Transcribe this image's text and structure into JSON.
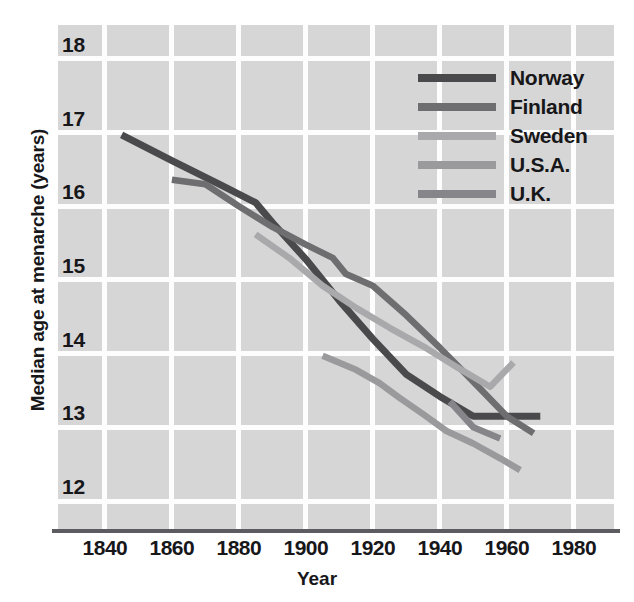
{
  "chart_data": {
    "type": "line",
    "title": "",
    "xlabel": "Year",
    "ylabel": "Median age at menarche (years)",
    "xlim": [
      1826,
      1992
    ],
    "ylim": [
      11.62,
      18.46
    ],
    "xticks": [
      1840,
      1860,
      1880,
      1900,
      1920,
      1940,
      1960,
      1980
    ],
    "yticks": [
      12,
      13,
      14,
      15,
      16,
      17,
      18
    ],
    "grid": true,
    "legend_position": "top-right",
    "background_color": "#d6d6d6",
    "gridline_color": "#fdfdfd",
    "series": [
      {
        "name": "Norway",
        "color": "#4a4a4d",
        "points": [
          [
            1845,
            16.97
          ],
          [
            1860,
            16.62
          ],
          [
            1875,
            16.28
          ],
          [
            1885,
            16.05
          ],
          [
            1890,
            15.78
          ],
          [
            1900,
            15.28
          ],
          [
            1910,
            14.72
          ],
          [
            1920,
            14.2
          ],
          [
            1930,
            13.72
          ],
          [
            1940,
            13.42
          ],
          [
            1950,
            13.15
          ],
          [
            1970,
            13.15
          ]
        ]
      },
      {
        "name": "Finland",
        "color": "#6e6e71",
        "points": [
          [
            1860,
            16.36
          ],
          [
            1870,
            16.3
          ],
          [
            1880,
            16.0
          ],
          [
            1890,
            15.72
          ],
          [
            1900,
            15.48
          ],
          [
            1908,
            15.3
          ],
          [
            1912,
            15.08
          ],
          [
            1920,
            14.92
          ],
          [
            1930,
            14.52
          ],
          [
            1940,
            14.08
          ],
          [
            1950,
            13.62
          ],
          [
            1960,
            13.15
          ],
          [
            1968,
            12.92
          ]
        ]
      },
      {
        "name": "Sweden",
        "color": "#a9a9ac",
        "points": [
          [
            1885,
            15.62
          ],
          [
            1895,
            15.3
          ],
          [
            1905,
            14.92
          ],
          [
            1915,
            14.62
          ],
          [
            1925,
            14.35
          ],
          [
            1935,
            14.1
          ],
          [
            1945,
            13.82
          ],
          [
            1955,
            13.55
          ],
          [
            1962,
            13.88
          ]
        ]
      },
      {
        "name": "U.S.A.",
        "color": "#9a9a9d",
        "points": [
          [
            1905,
            13.97
          ],
          [
            1915,
            13.78
          ],
          [
            1922,
            13.6
          ],
          [
            1928,
            13.4
          ],
          [
            1935,
            13.18
          ],
          [
            1942,
            12.95
          ],
          [
            1950,
            12.78
          ],
          [
            1958,
            12.58
          ],
          [
            1964,
            12.42
          ]
        ]
      },
      {
        "name": "U.K.",
        "color": "#86868a",
        "points": [
          [
            1943,
            13.35
          ],
          [
            1950,
            13.0
          ],
          [
            1958,
            12.85
          ]
        ]
      }
    ]
  },
  "legend": {
    "items": [
      {
        "label": "Norway",
        "color": "#4a4a4d"
      },
      {
        "label": "Finland",
        "color": "#6e6e71"
      },
      {
        "label": "Sweden",
        "color": "#a9a9ac"
      },
      {
        "label": "U.S.A.",
        "color": "#9a9a9d"
      },
      {
        "label": "U.K.",
        "color": "#86868a"
      }
    ]
  },
  "axes": {
    "y_title": "Median age at menarche (years)",
    "x_title": "Year",
    "y_tick_labels": [
      "18",
      "17",
      "16",
      "15",
      "14",
      "13",
      "12"
    ],
    "x_tick_labels": [
      "1840",
      "1860",
      "1880",
      "1900",
      "1920",
      "1940",
      "1960",
      "1980"
    ]
  }
}
